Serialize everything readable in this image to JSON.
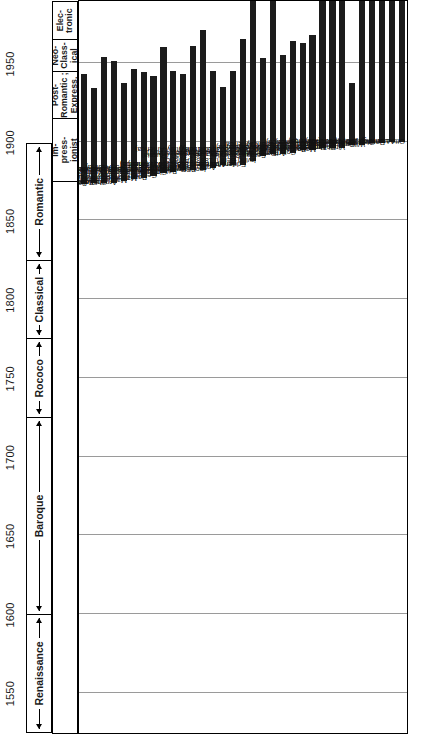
{
  "figure": {
    "axis": {
      "label": "Year",
      "ticks": [
        "1550",
        "1600",
        "1650",
        "1700",
        "1750",
        "1800",
        "1850",
        "1900",
        "1950"
      ],
      "tick_values": [
        1550,
        1600,
        1650,
        1700,
        1750,
        1800,
        1850,
        1900,
        1950
      ],
      "range": [
        1525,
        1990
      ]
    },
    "eras_broad": [
      {
        "name": "Renaissance",
        "start": 1525,
        "end": 1600,
        "style": "arrow-both"
      },
      {
        "name": "Baroque",
        "start": 1600,
        "end": 1725,
        "style": "arrow-both"
      },
      {
        "name": "Rococo",
        "start": 1725,
        "end": 1775,
        "style": "arrow-both"
      },
      {
        "name": "Classical",
        "start": 1775,
        "end": 1825,
        "style": "arrow-both"
      },
      {
        "name": "Romantic",
        "start": 1825,
        "end": 1900,
        "style": "arrow-both"
      }
    ],
    "eras_modern": [
      {
        "name": "Im-\npress-\nionist",
        "start": 1875,
        "end": 1915
      },
      {
        "name": "Post-\nRomantic ;\nExpress.",
        "start": 1915,
        "end": 1945
      },
      {
        "name": "Neo-\nClass-\nical",
        "start": 1945,
        "end": 1965
      },
      {
        "name": "Elec-\ntronic",
        "start": 1965,
        "end": 1990
      }
    ],
    "gridline_years": [
      1550,
      1600,
      1650,
      1700,
      1750,
      1800,
      1850,
      1900,
      1950
    ]
  },
  "chart_data": {
    "type": "bar",
    "orientation": "horizontal-lifespan",
    "xlabel": "Year",
    "ylabel": "",
    "xlim": [
      1525,
      1990
    ],
    "grid": true,
    "legend": "none",
    "categories": [
      "Sergey Rachmaninoff, 1873-1943 (Russia)",
      "Gustav Holst, 1874-1934 (England)",
      "Charles Ives, 1874-1954 (America)",
      "Arnold Schoenberg, 1874-1951 (Austria)",
      "Maurice Ravel, 1875-1937 (France)",
      "Manuel de Falla, 1876-1946 (Spain)",
      "Paul Tschesnokov, 1877-1944 (Russia)",
      "George M. Cohan, 1878-1942 (America)",
      "Clarence Cameron White, 1880-1960 (America)",
      "Béla Bartók, 1881-1945 (Hungary)",
      "R. Nathaniel Dett, 1882-1943 (America)",
      "Percy Grainger, 1882-1961 (Australia)",
      "Igor Stravinsky, 1882-1971 (Russia-America)",
      "Anton von Webern, 1883-1945 (Austria)",
      "Alban Berg, 1885-1935 (Austria)",
      "Jerome Kern, 1885-1945 (America)",
      "Edgard Varèse, 1885-1965 (France)",
      "Irving Berlin, 1888- (America)",
      "Sergey Prokofiev, 1891-1953 (Russia)",
      "Darius Milhaud, 1892- (France)",
      "Arthur Honegger, 1892-1955 (Switzerland)",
      "Cole Porter, 1893-1964 (America)",
      "Paul Hindemith, 1895-1963 (Germany)",
      "Mario Castelnuovo-Tedesco, 1895-1968 (Italy-America)",
      "Howard Hanson, 1896- (America)",
      "Roger Sessions, 1896- (America)",
      "Virgil Thomson, 1896- (America)",
      "George Gershwin, 1898-1937 (America)",
      "William L. Dawson, 1898- (America)",
      "Georges Auric, 1899- (France)",
      "Randall Thompson, 1899- (America)",
      "Aaron Copland, 1900- (America)",
      "Otto Luening, 1900- (America)"
    ],
    "spans": [
      {
        "name": "Sergey Rachmaninoff",
        "birth": 1873,
        "death": 1943,
        "country": "Russia"
      },
      {
        "name": "Gustav Holst",
        "birth": 1874,
        "death": 1934,
        "country": "England"
      },
      {
        "name": "Charles Ives",
        "birth": 1874,
        "death": 1954,
        "country": "America"
      },
      {
        "name": "Arnold Schoenberg",
        "birth": 1874,
        "death": 1951,
        "country": "Austria"
      },
      {
        "name": "Maurice Ravel",
        "birth": 1875,
        "death": 1937,
        "country": "France"
      },
      {
        "name": "Manuel de Falla",
        "birth": 1876,
        "death": 1946,
        "country": "Spain"
      },
      {
        "name": "Paul Tschesnokov",
        "birth": 1877,
        "death": 1944,
        "country": "Russia"
      },
      {
        "name": "George M. Cohan",
        "birth": 1878,
        "death": 1942,
        "country": "America"
      },
      {
        "name": "Clarence Cameron White",
        "birth": 1880,
        "death": 1960,
        "country": "America"
      },
      {
        "name": "Béla Bartók",
        "birth": 1881,
        "death": 1945,
        "country": "Hungary"
      },
      {
        "name": "R. Nathaniel Dett",
        "birth": 1882,
        "death": 1943,
        "country": "America"
      },
      {
        "name": "Percy Grainger",
        "birth": 1882,
        "death": 1961,
        "country": "Australia"
      },
      {
        "name": "Igor Stravinsky",
        "birth": 1882,
        "death": 1971,
        "country": "Russia-America"
      },
      {
        "name": "Anton von Webern",
        "birth": 1883,
        "death": 1945,
        "country": "Austria"
      },
      {
        "name": "Alban Berg",
        "birth": 1885,
        "death": 1935,
        "country": "Austria"
      },
      {
        "name": "Jerome Kern",
        "birth": 1885,
        "death": 1945,
        "country": "America"
      },
      {
        "name": "Edgard Varèse",
        "birth": 1885,
        "death": 1965,
        "country": "France"
      },
      {
        "name": "Irving Berlin",
        "birth": 1888,
        "death": null,
        "country": "America"
      },
      {
        "name": "Sergey Prokofiev",
        "birth": 1891,
        "death": 1953,
        "country": "Russia"
      },
      {
        "name": "Darius Milhaud",
        "birth": 1892,
        "death": null,
        "country": "France"
      },
      {
        "name": "Arthur Honegger",
        "birth": 1892,
        "death": 1955,
        "country": "Switzerland"
      },
      {
        "name": "Cole Porter",
        "birth": 1893,
        "death": 1964,
        "country": "America"
      },
      {
        "name": "Paul Hindemith",
        "birth": 1895,
        "death": 1963,
        "country": "Germany"
      },
      {
        "name": "Mario Castelnuovo-Tedesco",
        "birth": 1895,
        "death": 1968,
        "country": "Italy-America"
      },
      {
        "name": "Howard Hanson",
        "birth": 1896,
        "death": null,
        "country": "America"
      },
      {
        "name": "Roger Sessions",
        "birth": 1896,
        "death": null,
        "country": "America"
      },
      {
        "name": "Virgil Thomson",
        "birth": 1896,
        "death": null,
        "country": "America"
      },
      {
        "name": "George Gershwin",
        "birth": 1898,
        "death": 1937,
        "country": "America"
      },
      {
        "name": "William L. Dawson",
        "birth": 1898,
        "death": null,
        "country": "America"
      },
      {
        "name": "Georges Auric",
        "birth": 1899,
        "death": null,
        "country": "France"
      },
      {
        "name": "Randall Thompson",
        "birth": 1899,
        "death": null,
        "country": "America"
      },
      {
        "name": "Aaron Copland",
        "birth": 1900,
        "death": null,
        "country": "America"
      },
      {
        "name": "Otto Luening",
        "birth": 1900,
        "death": null,
        "country": "America"
      }
    ]
  }
}
